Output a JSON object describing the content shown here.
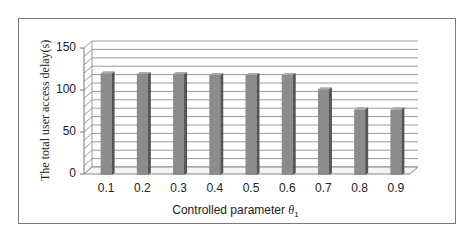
{
  "chart_data": {
    "type": "bar",
    "style": "3d-clustered-column",
    "title": "",
    "xlabel": "Controlled parameter θ1",
    "xlabel_parts": {
      "text": "Controlled  parameter ",
      "symbol": "θ",
      "subscript": "1"
    },
    "ylabel": "The total user access delay(s)",
    "categories": [
      "0.1",
      "0.2",
      "0.3",
      "0.4",
      "0.5",
      "0.6",
      "0.7",
      "0.8",
      "0.9"
    ],
    "values": [
      120,
      119,
      119,
      118,
      118,
      118,
      101,
      77,
      77
    ],
    "ylim": [
      0,
      150
    ],
    "yticks": [
      0,
      50,
      100,
      150
    ],
    "grid": {
      "on": true,
      "step": 10
    },
    "legend": null,
    "colors": {
      "bar_front": "#8c8c8c",
      "bar_side": "#555555",
      "bar_top": "#a8a8a8",
      "grid": "#9a9a9a",
      "frame": "#7a7a7a"
    }
  }
}
